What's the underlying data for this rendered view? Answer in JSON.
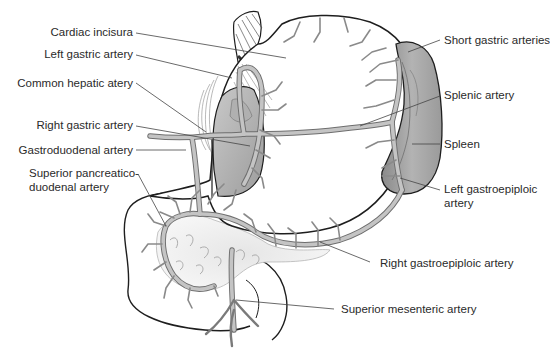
{
  "diagram": {
    "type": "anatomical-illustration",
    "colors": {
      "background": "#ffffff",
      "outline": "#1e1e1e",
      "artery_fill": "#bdbdbd",
      "artery_edge": "#6e6e6e",
      "spleen_fill": "#a9a9a9",
      "spleen_dark": "#7d7d7d",
      "stomach_fill": "#ffffff",
      "pancreas_fill": "#ededed",
      "leader_line": "#444444",
      "label_text": "#2a2a2a"
    },
    "labels_left": [
      {
        "id": "cardiac-incisura",
        "text": "Cardiac incisura"
      },
      {
        "id": "left-gastric-artery",
        "text": "Left gastric artery"
      },
      {
        "id": "common-hepatic-artery",
        "text": "Common hepatic atery"
      },
      {
        "id": "right-gastric-artery",
        "text": "Right gastric artery"
      },
      {
        "id": "gastroduodenal-artery",
        "text": "Gastroduodenal artery"
      },
      {
        "id": "superior-pancreaticoduodenal-artery",
        "line1": "Superior pancreatico-",
        "line2": "duodenal artery"
      }
    ],
    "labels_right": [
      {
        "id": "short-gastric-arteries",
        "text": "Short gastric arteries"
      },
      {
        "id": "splenic-artery",
        "text": "Splenic artery"
      },
      {
        "id": "spleen",
        "text": "Spleen"
      },
      {
        "id": "left-gastroepiploic-artery",
        "line1": "Left gastroepiploic",
        "line2": "artery"
      }
    ],
    "labels_bottom": [
      {
        "id": "right-gastroepiploic-artery",
        "text": "Right gastroepiploic artery"
      },
      {
        "id": "superior-mesenteric-artery",
        "text": "Superior mesenteric artery"
      }
    ]
  }
}
